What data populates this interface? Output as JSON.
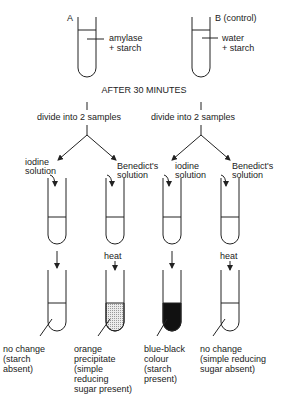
{
  "tubes_top": {
    "a": {
      "label": "A",
      "contents_line1": "amylase",
      "contents_line2": "+ starch"
    },
    "b": {
      "label": "B (control)",
      "contents_line1": "water",
      "contents_line2": "+ starch"
    }
  },
  "time_label": "AFTER 30 MINUTES",
  "divide_left": "divide into 2 samples",
  "divide_right": "divide into 2 samples",
  "reagents": [
    {
      "line1": "iodine",
      "line2": "solution"
    },
    {
      "line1": "Benedict's",
      "line2": "solution"
    },
    {
      "line1": "iodine",
      "line2": "solution"
    },
    {
      "line1": "Benedict's",
      "line2": "solution"
    }
  ],
  "heat_label": "heat",
  "results": [
    {
      "text": "no change\n(starch\nabsent)",
      "fill": "none"
    },
    {
      "text": "orange\nprecipitate\n(simple\nreducing\nsugar present)",
      "fill": "stippled"
    },
    {
      "text": "blue-black\ncolour\n(starch\npresent)",
      "fill": "black"
    },
    {
      "text": "no change\n(simple reducing\nsugar absent)",
      "fill": "none"
    }
  ],
  "colors": {
    "ink": "#222222",
    "stipple": "#cfcfcf",
    "black": "#111111"
  }
}
